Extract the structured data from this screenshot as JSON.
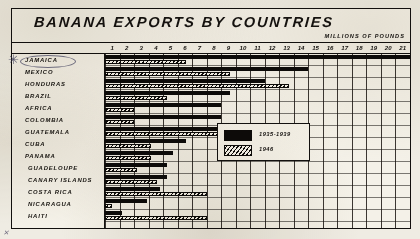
{
  "chart_data": {
    "type": "bar",
    "title": "BANANA EXPORTS BY COUNTRIES",
    "xlabel": "MILLIONS OF POUNDS",
    "ylabel": "",
    "orientation": "horizontal",
    "grid": true,
    "xlim": [
      0,
      21
    ],
    "xticks": [
      1,
      2,
      3,
      4,
      5,
      6,
      7,
      8,
      9,
      10,
      11,
      12,
      13,
      14,
      15,
      16,
      17,
      18,
      19,
      20,
      21
    ],
    "xtick_labels": [
      "1",
      "2",
      "3",
      "4",
      "5",
      "6",
      "7",
      "8",
      "9",
      "10",
      "11",
      "12",
      "13",
      "14",
      "15",
      "16",
      "17",
      "18",
      "19",
      "20",
      "21"
    ],
    "legend_position": "inside-right",
    "categories": [
      "JAMAICA",
      "MEXICO",
      "HONDURAS",
      "BRAZIL",
      "AFRICA",
      "COLOMBIA",
      "GUATEMALA",
      "CUBA",
      "PANAMA",
      "GUADELOUPE",
      "CANARY ISLANDS",
      "COSTA RICA",
      "NICARAGUA",
      "HAITI"
    ],
    "series": [
      {
        "name": "1935-1939",
        "pattern": "solid",
        "color": "#0d0b09",
        "values": [
          21.0,
          14.0,
          11.0,
          8.6,
          8.0,
          8.0,
          8.0,
          5.6,
          4.7,
          4.3,
          4.3,
          3.8,
          2.9,
          1.2
        ]
      },
      {
        "name": "1946",
        "pattern": "hatched",
        "color": "#0d0b09",
        "values": [
          5.6,
          8.6,
          12.7,
          4.3,
          2.0,
          2.0,
          10.4,
          3.2,
          3.2,
          2.2,
          3.6,
          7.0,
          0.5,
          7.0
        ]
      }
    ]
  },
  "legend": {
    "entries": [
      {
        "label": "1935-1939",
        "swatch": "solid"
      },
      {
        "label": "1946",
        "swatch": "hatched"
      }
    ]
  },
  "annotations": {
    "highlight_country": "JAMAICA",
    "arrow_icon": "arrow-pointer-icon",
    "corner_mark": "✕"
  },
  "colors": {
    "ink": "#0d0b09",
    "paper": "#f4f1e8",
    "page": "#efece3",
    "highlight_ring": "#4a4a68"
  }
}
